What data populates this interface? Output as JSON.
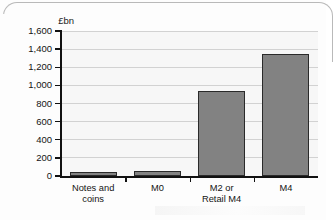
{
  "figure": {
    "frame_style": "rounded-top-border",
    "background_color": "#fdfdfd"
  },
  "chart_data": {
    "type": "bar",
    "title": "",
    "subtitle": "",
    "xlabel": "",
    "ylabel": "£bn",
    "categories": [
      "Notes and\ncoins",
      "M0",
      "M2 or\nRetail M4",
      "M4"
    ],
    "values": [
      40,
      55,
      940,
      1350
    ],
    "ylim": [
      0,
      1600
    ],
    "ytick_values": [
      0,
      200,
      400,
      600,
      800,
      1000,
      1200,
      1400,
      1600
    ],
    "ytick_labels": [
      "0",
      "200",
      "400",
      "600",
      "800",
      "1,000",
      "1,200",
      "1,400",
      "1,600"
    ],
    "grid": true,
    "grid_axis": "y",
    "legend": false,
    "legend_position": "none",
    "bar_fill_color": "#828282",
    "bar_edge_color": "#2a2a2a",
    "plot_background_color": "#f7f7f7",
    "gridline_color": "#d2d2d2",
    "axis_color": "#111111"
  }
}
